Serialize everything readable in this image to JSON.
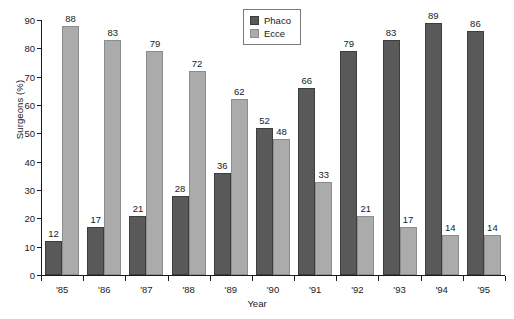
{
  "chart_data": {
    "type": "bar",
    "title": "",
    "xlabel": "Year",
    "ylabel": "Surgeons (%)",
    "ylim": [
      0,
      90
    ],
    "yticks": [
      0,
      10,
      20,
      30,
      40,
      50,
      60,
      70,
      80,
      90
    ],
    "grid": false,
    "legend_position": "top-center",
    "categories": [
      "'85",
      "'86",
      "'87",
      "'88",
      "'89",
      "'90",
      "'91",
      "'92",
      "'93",
      "'94",
      "'95"
    ],
    "series": [
      {
        "name": "Phaco",
        "color": "#595959",
        "values": [
          12,
          17,
          21,
          28,
          36,
          52,
          66,
          79,
          83,
          89,
          86
        ]
      },
      {
        "name": "Ecce",
        "color": "#ababab",
        "values": [
          88,
          83,
          79,
          72,
          62,
          48,
          33,
          21,
          17,
          14,
          14
        ]
      }
    ]
  }
}
